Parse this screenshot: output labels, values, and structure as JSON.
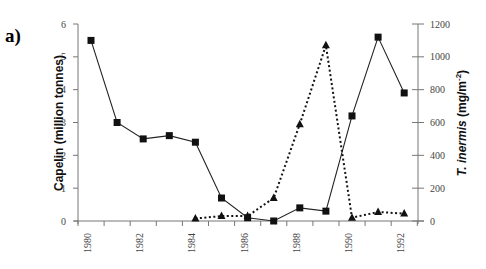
{
  "panel_label": "a)",
  "colors": {
    "marker": "#111111",
    "axis": "#777777",
    "line": "#222222"
  },
  "chart_data": {
    "type": "line",
    "title": "",
    "xlabel": "",
    "ylabel": "Capelin (million tonnes)",
    "y2label": "T. inermis (mg/m-2)",
    "y2label_parts": {
      "italic": "T. inermis",
      "rest": " (mg/m",
      "sup": "-2",
      "close": ")"
    },
    "xlim": [
      1980,
      1992
    ],
    "ylim": [
      0,
      6
    ],
    "y2lim": [
      0,
      1200
    ],
    "x_ticks": [
      "1980",
      "1982",
      "1984",
      "1986",
      "1988",
      "1990",
      "1992"
    ],
    "y_ticks": [
      "0",
      "1",
      "2",
      "3",
      "4",
      "5",
      "6"
    ],
    "y2_ticks": [
      "0",
      "200",
      "400",
      "600",
      "800",
      "1000",
      "1200"
    ],
    "grid": false,
    "series": [
      {
        "name": "Capelin",
        "axis": "left",
        "marker": "square",
        "line": "solid",
        "x": [
          1980,
          1981,
          1982,
          1983,
          1984,
          1985,
          1986,
          1987,
          1988,
          1989,
          1990,
          1991,
          1992
        ],
        "values": [
          5.5,
          3.0,
          2.5,
          2.6,
          2.4,
          0.7,
          0.1,
          0.0,
          0.4,
          0.3,
          3.2,
          5.6,
          3.9
        ]
      },
      {
        "name": "T. inermis",
        "axis": "right",
        "marker": "triangle",
        "line": "dotted",
        "x": [
          1984,
          1985,
          1986,
          1987,
          1988,
          1989,
          1990,
          1991,
          1992
        ],
        "values": [
          15,
          30,
          30,
          140,
          590,
          1070,
          20,
          55,
          45
        ]
      }
    ]
  }
}
